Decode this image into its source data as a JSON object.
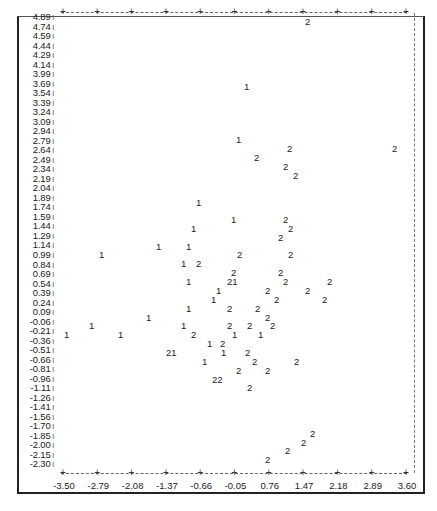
{
  "chart_data": {
    "type": "scatter",
    "title": "",
    "xlabel": "",
    "ylabel": "",
    "x_ticks": [
      "-3.50",
      "-2.79",
      "-2.08",
      "-1.37",
      "-0.66",
      "-0.05",
      "0.76",
      "1.47",
      "2.18",
      "2.89",
      "3.60"
    ],
    "y_ticks": [
      "4.89",
      "4.74",
      "4.59",
      "4.44",
      "4.29",
      "4.14",
      "3.99",
      "3.69",
      "3.54",
      "3.39",
      "3.24",
      "3.09",
      "2.94",
      "2.79",
      "2.64",
      "2.49",
      "2.34",
      "2.19",
      "2.04",
      "1.89",
      "1.74",
      "1.59",
      "1.44",
      "1.29",
      "1.14",
      "0.99",
      "0.84",
      "0.69",
      "0.54",
      "0.39",
      "0.24",
      "0.09",
      "-0.06",
      "-0.21",
      "-0.36",
      "-0.51",
      "-0.66",
      "-0.81",
      "-0.96",
      "-1.11",
      "-1.26",
      "-1.41",
      "-1.56",
      "-1.70",
      "-1.85",
      "-2.00",
      "-2.15",
      "-2.30"
    ],
    "xlim": [
      -3.5,
      3.6
    ],
    "ylim": [
      -2.3,
      4.89
    ],
    "grid": false,
    "legend": "none (points plotted as group labels '1' and '2')",
    "series": [
      {
        "name": "1",
        "points": [
          [
            -0.38,
            4.29
          ],
          [
            -0.48,
            3.24
          ],
          [
            -0.95,
            2.19
          ],
          [
            -0.48,
            1.89
          ],
          [
            -1.0,
            1.74
          ],
          [
            -1.37,
            1.44
          ],
          [
            -1.07,
            1.44
          ],
          [
            -2.98,
            1.29
          ],
          [
            -1.2,
            1.14
          ],
          [
            -1.0,
            0.84
          ],
          [
            -0.38,
            0.84
          ],
          [
            -1.0,
            0.69
          ],
          [
            -0.85,
            0.54
          ],
          [
            -0.48,
            0.39
          ],
          [
            -1.0,
            0.39
          ],
          [
            -1.75,
            0.24
          ],
          [
            -2.79,
            0.09
          ],
          [
            -1.2,
            0.09
          ],
          [
            -3.5,
            -0.06
          ],
          [
            -2.1,
            -0.06
          ],
          [
            -0.25,
            -0.06
          ],
          [
            0.48,
            -0.06
          ],
          [
            -0.7,
            -0.21
          ],
          [
            -1.25,
            -0.36
          ],
          [
            -0.6,
            -0.36
          ],
          [
            -0.85,
            -0.51
          ]
        ]
      },
      {
        "name": "2",
        "points": [
          [
            1.47,
            4.89
          ],
          [
            0.48,
            3.09
          ],
          [
            3.42,
            3.09
          ],
          [
            -0.05,
            2.94
          ],
          [
            0.48,
            2.79
          ],
          [
            0.76,
            2.64
          ],
          [
            0.48,
            1.89
          ],
          [
            0.6,
            1.74
          ],
          [
            0.4,
            1.59
          ],
          [
            -0.45,
            1.29
          ],
          [
            0.55,
            1.29
          ],
          [
            -0.95,
            1.14
          ],
          [
            0.45,
            0.99
          ],
          [
            -0.48,
            0.99
          ],
          [
            -0.45,
            0.84
          ],
          [
            0.5,
            0.84
          ],
          [
            1.9,
            0.84
          ],
          [
            -0.45,
            0.69
          ],
          [
            0.48,
            0.69
          ],
          [
            1.15,
            0.69
          ],
          [
            -0.35,
            0.54
          ],
          [
            0.35,
            0.54
          ],
          [
            1.7,
            0.54
          ],
          [
            -0.55,
            0.39
          ],
          [
            0.0,
            0.39
          ],
          [
            0.05,
            0.24
          ],
          [
            0.48,
            0.24
          ],
          [
            -0.6,
            0.09
          ],
          [
            -0.1,
            0.09
          ],
          [
            0.2,
            0.09
          ],
          [
            -0.8,
            -0.06
          ],
          [
            -0.8,
            -0.21
          ],
          [
            -1.0,
            -0.36
          ],
          [
            0.1,
            -0.36
          ],
          [
            -0.2,
            -0.51
          ],
          [
            0.76,
            -0.51
          ],
          [
            -0.3,
            -0.66
          ],
          [
            0.4,
            -0.66
          ],
          [
            -0.65,
            -0.81
          ],
          [
            -0.55,
            -0.81
          ],
          [
            0.05,
            -0.96
          ],
          [
            1.4,
            -1.7
          ],
          [
            1.15,
            -1.85
          ],
          [
            0.85,
            -2.0
          ],
          [
            0.5,
            -2.15
          ]
        ]
      }
    ]
  },
  "plot_labels": [
    {
      "t": "2",
      "x": 305,
      "y": 12
    },
    {
      "t": "1",
      "x": 244,
      "y": 77
    },
    {
      "t": "1",
      "x": 236,
      "y": 130
    },
    {
      "t": "2",
      "x": 287,
      "y": 139
    },
    {
      "t": "2",
      "x": 392,
      "y": 139
    },
    {
      "t": "2",
      "x": 254,
      "y": 148
    },
    {
      "t": "2",
      "x": 283,
      "y": 157
    },
    {
      "t": "2",
      "x": 293,
      "y": 166
    },
    {
      "t": "1",
      "x": 196,
      "y": 193
    },
    {
      "t": "1",
      "x": 231,
      "y": 210
    },
    {
      "t": "2",
      "x": 283,
      "y": 210
    },
    {
      "t": "1",
      "x": 191,
      "y": 219
    },
    {
      "t": "2",
      "x": 288,
      "y": 219
    },
    {
      "t": "2",
      "x": 278,
      "y": 228
    },
    {
      "t": "1",
      "x": 156,
      "y": 237
    },
    {
      "t": "1",
      "x": 186,
      "y": 237
    },
    {
      "t": "1",
      "x": 99,
      "y": 245
    },
    {
      "t": "2",
      "x": 237,
      "y": 245
    },
    {
      "t": "2",
      "x": 288,
      "y": 245
    },
    {
      "t": "1",
      "x": 181,
      "y": 254
    },
    {
      "t": "2",
      "x": 196,
      "y": 254
    },
    {
      "t": "2",
      "x": 231,
      "y": 263
    },
    {
      "t": "2",
      "x": 278,
      "y": 263
    },
    {
      "t": "21",
      "x": 227,
      "y": 272
    },
    {
      "t": "1",
      "x": 186,
      "y": 272
    },
    {
      "t": "2",
      "x": 283,
      "y": 272
    },
    {
      "t": "2",
      "x": 327,
      "y": 272
    },
    {
      "t": "1",
      "x": 216,
      "y": 281
    },
    {
      "t": "2",
      "x": 265,
      "y": 281
    },
    {
      "t": "2",
      "x": 305,
      "y": 281
    },
    {
      "t": "1",
      "x": 211,
      "y": 290
    },
    {
      "t": "2",
      "x": 274,
      "y": 290
    },
    {
      "t": "2",
      "x": 322,
      "y": 290
    },
    {
      "t": "1",
      "x": 186,
      "y": 299
    },
    {
      "t": "2",
      "x": 227,
      "y": 299
    },
    {
      "t": "2",
      "x": 255,
      "y": 299
    },
    {
      "t": "1",
      "x": 146,
      "y": 308
    },
    {
      "t": "2",
      "x": 265,
      "y": 308
    },
    {
      "t": "1",
      "x": 89,
      "y": 316
    },
    {
      "t": "1",
      "x": 181,
      "y": 316
    },
    {
      "t": "2",
      "x": 227,
      "y": 316
    },
    {
      "t": "2",
      "x": 247,
      "y": 316
    },
    {
      "t": "1",
      "x": 64,
      "y": 325
    },
    {
      "t": "1",
      "x": 118,
      "y": 325
    },
    {
      "t": "2",
      "x": 191,
      "y": 325
    },
    {
      "t": "1",
      "x": 232,
      "y": 325
    },
    {
      "t": "2",
      "x": 270,
      "y": 316
    },
    {
      "t": "1",
      "x": 258,
      "y": 325
    },
    {
      "t": "1",
      "x": 207,
      "y": 334
    },
    {
      "t": "2",
      "x": 220,
      "y": 334
    },
    {
      "t": "21",
      "x": 166,
      "y": 343
    },
    {
      "t": "1",
      "x": 221,
      "y": 343
    },
    {
      "t": "2",
      "x": 245,
      "y": 343
    },
    {
      "t": "1",
      "x": 202,
      "y": 352
    },
    {
      "t": "2",
      "x": 252,
      "y": 352
    },
    {
      "t": "2",
      "x": 294,
      "y": 352
    },
    {
      "t": "2",
      "x": 236,
      "y": 361
    },
    {
      "t": "2",
      "x": 265,
      "y": 361
    },
    {
      "t": "22",
      "x": 212,
      "y": 370
    },
    {
      "t": "2",
      "x": 247,
      "y": 378
    },
    {
      "t": "2",
      "x": 310,
      "y": 424
    },
    {
      "t": "2",
      "x": 301,
      "y": 433
    },
    {
      "t": "2",
      "x": 285,
      "y": 441
    },
    {
      "t": "2",
      "x": 265,
      "y": 450
    }
  ]
}
